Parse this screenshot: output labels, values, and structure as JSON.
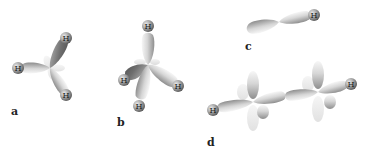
{
  "diagram": {
    "panels": [
      {
        "id": "a",
        "label": "a",
        "atom_label": "H",
        "bonded_atoms": 3
      },
      {
        "id": "b",
        "label": "b",
        "atom_label": "H",
        "bonded_atoms": 4
      },
      {
        "id": "c",
        "label": "c",
        "atom_label": "H",
        "bonded_atoms": 1
      },
      {
        "id": "d",
        "label": "d",
        "atom_label": "H",
        "bonded_atoms": 2
      }
    ],
    "colors": {
      "lobe_light": "#f2f2f2",
      "lobe_mid": "#c4c4c4",
      "lobe_dark": "#7a7a7a",
      "atom": "#8c8c8c",
      "pale_lobe": "#e6e6e6"
    }
  }
}
